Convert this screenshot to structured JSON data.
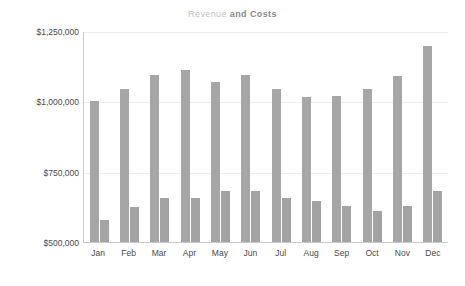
{
  "chart_data": {
    "type": "bar",
    "title": "Revenue and Costs",
    "title_parts": {
      "light": "Revenue",
      "strong": " and Costs"
    },
    "xlabel": "",
    "ylabel": "",
    "categories": [
      "Jan",
      "Feb",
      "Mar",
      "Apr",
      "May",
      "Jun",
      "Jul",
      "Aug",
      "Sep",
      "Oct",
      "Nov",
      "Dec"
    ],
    "series": [
      {
        "name": "Revenue",
        "color": "#a6a6a6",
        "values": [
          1000000,
          1045000,
          1095000,
          1110000,
          1070000,
          1095000,
          1043000,
          1015000,
          1020000,
          1043000,
          1090000,
          1197000
        ]
      },
      {
        "name": "Costs",
        "color": "#a3a3a3",
        "values": [
          580000,
          625000,
          655000,
          655000,
          680000,
          680000,
          655000,
          645000,
          627000,
          610000,
          627000,
          680000
        ]
      }
    ],
    "ylim": [
      500000,
      1250000
    ],
    "ytick_values": [
      1250000,
      1000000,
      750000,
      500000
    ],
    "ytick_labels": [
      "$1,250,000",
      "$1,000,000",
      "$750,000",
      "$500,000"
    ],
    "grid": true,
    "gridline_color": "#ededed",
    "axis_color": "#c9c9c9",
    "legend": null,
    "legend_position": "none",
    "background": "#ffffff"
  }
}
